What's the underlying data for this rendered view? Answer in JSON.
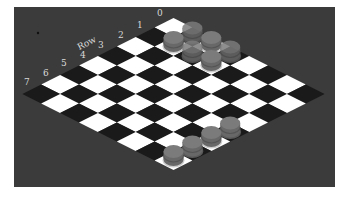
{
  "game": {
    "type": "checkers",
    "board_size": 8,
    "axis_title": "Row",
    "row_labels": [
      "0",
      "1",
      "2",
      "3",
      "4",
      "5",
      "6",
      "7"
    ],
    "pieces": [
      {
        "row": 0,
        "col": 1,
        "label": "piece",
        "faded": true
      },
      {
        "row": 1,
        "col": 1,
        "label": "piece",
        "faded": false
      },
      {
        "row": 0,
        "col": 2,
        "label": "piece",
        "faded": false
      },
      {
        "row": 1,
        "col": 2,
        "label": "piece",
        "faded": true
      },
      {
        "row": 1,
        "col": 3,
        "label": "piece",
        "faded": false
      },
      {
        "row": 0,
        "col": 3,
        "label": "piece",
        "faded": true
      },
      {
        "row": 7,
        "col": 7,
        "label": "piece",
        "faded": false
      },
      {
        "row": 6,
        "col": 7,
        "label": "piece",
        "faded": false
      },
      {
        "row": 5,
        "col": 7,
        "label": "piece",
        "faded": false
      },
      {
        "row": 4,
        "col": 7,
        "label": "piece",
        "faded": false
      }
    ]
  },
  "colors": {
    "background_panel": "#3b3b3b",
    "light_square": "#ffffff",
    "dark_square": "#1a1a1a",
    "piece_body": "#7b7b7b",
    "piece_band": "#555555",
    "label_text": "#d9d9d9"
  }
}
